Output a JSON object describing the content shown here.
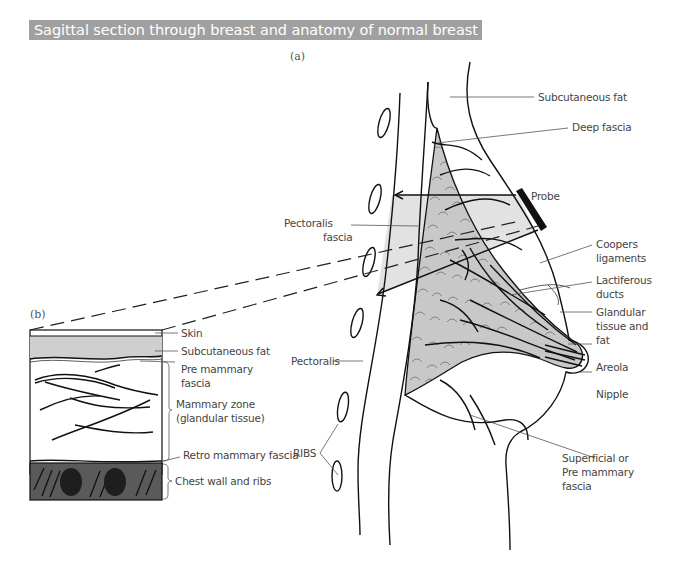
{
  "title": "Sagittal section through breast and anatomy of normal breast",
  "colors": {
    "title_bg": "#a0a0a0",
    "title_text": "#ffffff",
    "tissue_gray": "#c8c8c8",
    "beam_gray": "#e2e2e2",
    "subcut_gray": "#cfcfcf",
    "chest_wall": "#5a5a5a",
    "ribs_dark": "#1e1e1e"
  },
  "panel_a": {
    "label": "(a)",
    "labels": {
      "subcutaneous_fat": "Subcutaneous fat",
      "deep_fascia": "Deep fascia",
      "probe": "Probe",
      "pectoralis_fascia_1": "Pectoralis",
      "pectoralis_fascia_2": "fascia",
      "coopers_1": "Coopers",
      "coopers_2": "ligaments",
      "lactiferous_1": "Lactiferous",
      "lactiferous_2": "ducts",
      "glandular_1": "Glandular",
      "glandular_2": "tissue and",
      "glandular_3": "fat",
      "areola": "Areola",
      "nipple": "Nipple",
      "pectoralis": "Pectoralis",
      "ribs": "RIBS",
      "superficial_1": "Superficial or",
      "superficial_2": "Pre mammary",
      "superficial_3": "fascia"
    }
  },
  "panel_b": {
    "label": "(b)",
    "labels": {
      "skin": "Skin",
      "subcutaneous_fat": "Subcutaneous fat",
      "pre_mammary_1": "Pre mammary",
      "pre_mammary_2": "fascia",
      "mammary_zone_1": "Mammary zone",
      "mammary_zone_2": "(glandular tissue)",
      "retro_mammary": "Retro mammary fascia",
      "chest_wall": "Chest wall and ribs"
    }
  }
}
